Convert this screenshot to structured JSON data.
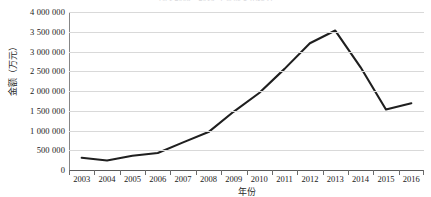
{
  "chart_data": {
    "type": "line",
    "title": "图 1 2003—2016 年金额变化趋势",
    "xlabel": "年份",
    "ylabel": "金额（万元）",
    "categories": [
      "2003",
      "2004",
      "2005",
      "2006",
      "2007",
      "2008",
      "2009",
      "2010",
      "2011",
      "2012",
      "2013",
      "2014",
      "2015",
      "2016"
    ],
    "values": [
      310000,
      240000,
      360000,
      430000,
      700000,
      960000,
      1480000,
      1950000,
      2560000,
      3210000,
      3530000,
      2600000,
      1530000,
      1690000
    ],
    "series": [
      {
        "name": "金额（万元）",
        "values": [
          310000,
          240000,
          360000,
          430000,
          700000,
          960000,
          1480000,
          1950000,
          2560000,
          3210000,
          3530000,
          2600000,
          1530000,
          1690000
        ]
      }
    ],
    "ylim": [
      0,
      4000000
    ],
    "ytick_values": [
      0,
      500000,
      1000000,
      1500000,
      2000000,
      2500000,
      3000000,
      3500000,
      4000000
    ],
    "ytick_labels": [
      "0",
      "500 000",
      "1 000 000",
      "1 500 000",
      "2 000 000",
      "2 500 000",
      "3 000 000",
      "3 500 000",
      "4 000 000"
    ],
    "grid": "horizontal",
    "legend": "none",
    "line_color": "#1f1f1f",
    "grid_color": "#d9d9d9",
    "axis_color": "#868686"
  }
}
